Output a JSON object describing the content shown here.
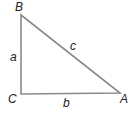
{
  "diagram": {
    "type": "right-triangle",
    "stroke_color": "#8a8a8a",
    "vertices": [
      {
        "label": "B",
        "x": 21,
        "y": 15
      },
      {
        "label": "C",
        "x": 21,
        "y": 94
      },
      {
        "label": "A",
        "x": 120,
        "y": 93
      }
    ],
    "sides": [
      {
        "label": "a",
        "between": "B-C"
      },
      {
        "label": "b",
        "between": "C-A"
      },
      {
        "label": "c",
        "between": "B-A"
      }
    ]
  }
}
